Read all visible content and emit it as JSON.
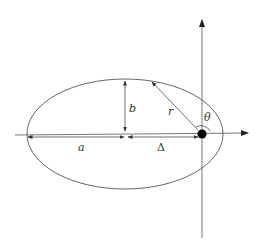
{
  "diagram": {
    "type": "ellipse-orbit",
    "labels": {
      "semi_major": "a",
      "semi_minor": "b",
      "radius": "r",
      "angle": "θ",
      "offset": "Δ"
    },
    "colors": {
      "stroke": "#555555",
      "focus": "#000000"
    }
  }
}
